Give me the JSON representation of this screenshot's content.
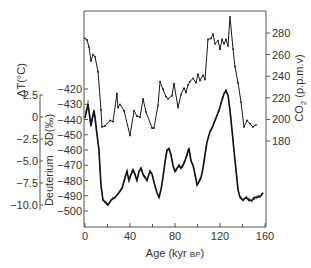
{
  "chart_data": {
    "type": "line",
    "title": "",
    "xlabel": "Age (kyr BP)",
    "xlabel_main": "Age (kyr ",
    "xlabel_unit": "BP",
    "xlabel_close": ")",
    "xlim": [
      0,
      160
    ],
    "xticks": [
      0,
      40,
      80,
      120,
      160
    ],
    "xminor_ticks": [
      20,
      60,
      100,
      140
    ],
    "grid": false,
    "legend": null,
    "axes": {
      "left_outer": {
        "label": "ΔT(°C)",
        "ticks": [
          "2.5",
          "0",
          "−2.5",
          "−5.0",
          "−7.5",
          "−10.0"
        ],
        "tick_values": [
          2.5,
          0,
          -2.5,
          -5.0,
          -7.5,
          -10.0
        ],
        "ylim": [
          -10.0,
          2.5
        ]
      },
      "left_inner": {
        "label": "Deuterium  δD(‰)",
        "label_part1": "Deuterium",
        "label_part2": "δD(‰)",
        "ticks": [
          "−420",
          "−430",
          "−440",
          "−450",
          "−460",
          "−470",
          "−480",
          "−490",
          "−500"
        ],
        "tick_values": [
          -420,
          -430,
          -440,
          -450,
          -460,
          -470,
          -480,
          -490,
          -500
        ],
        "ylim": [
          -500,
          -420
        ]
      },
      "right": {
        "label": "CO2 (p.p.m.v)",
        "label_main": "CO",
        "label_sub": "2",
        "label_unit": " (p.p.m.v)",
        "ticks": [
          "280",
          "260",
          "240",
          "220",
          "200",
          "180"
        ],
        "tick_values": [
          280,
          260,
          240,
          220,
          200,
          180
        ],
        "ylim": [
          180,
          280
        ]
      }
    },
    "series": [
      {
        "name": "CO2",
        "axis": "right",
        "style": "line-with-markers",
        "x": [
          0,
          1.8,
          3.6,
          5.3,
          7.1,
          8.9,
          11.6,
          14.2,
          15.1,
          17.8,
          22.2,
          24.9,
          28.4,
          29.3,
          31.1,
          34.7,
          40.0,
          43.6,
          46.2,
          48.9,
          51.6,
          54.2,
          59.6,
          61.3,
          64.9,
          66.7,
          69.3,
          72.0,
          73.8,
          77.3,
          79.1,
          82.7,
          85.3,
          88.0,
          89.8,
          91.6,
          93.3,
          96.0,
          98.7,
          100.4,
          102.2,
          104.9,
          106.7,
          109.3,
          112.0,
          113.8,
          115.6,
          118.2,
          120.0,
          121.8,
          123.6,
          125.3,
          127.1,
          128.9,
          131.6,
          133.3,
          136.0,
          138.7,
          141.3,
          144.0,
          146.7,
          149.3,
          152.0
        ],
        "values": [
          275,
          273.5,
          267,
          254,
          260,
          258,
          244,
          209,
          193,
          194,
          199,
          198,
          224,
          211,
          214,
          208,
          185,
          208,
          203,
          202,
          219,
          207,
          192,
          192,
          213,
          235,
          228,
          221,
          219,
          222,
          233,
          211,
          223,
          229,
          225,
          232,
          235,
          238,
          234,
          242,
          236,
          241,
          237,
          274,
          275,
          279,
          270,
          273,
          265,
          274,
          270,
          274,
          268,
          295,
          265,
          249,
          234,
          216,
          193,
          199,
          196,
          193,
          195
        ]
      },
      {
        "name": "Deuterium δD",
        "axis": "left_inner",
        "style": "noisy-line",
        "x": [
          0,
          2.7,
          5.3,
          8.0,
          9.8,
          10.7,
          12.4,
          14.2,
          16.0,
          17.8,
          20.4,
          23.1,
          26.7,
          30.2,
          32.9,
          35.6,
          37.3,
          39.1,
          40.9,
          42.7,
          44.4,
          46.2,
          48.0,
          49.8,
          51.6,
          53.3,
          55.1,
          57.8,
          59.6,
          61.3,
          64.0,
          65.8,
          67.6,
          69.3,
          71.1,
          72.9,
          74.7,
          76.4,
          78.2,
          80.0,
          81.8,
          83.6,
          85.3,
          87.1,
          88.9,
          90.7,
          92.4,
          94.2,
          96.0,
          97.8,
          99.6,
          101.3,
          103.1,
          104.9,
          106.7,
          108.4,
          111.1,
          113.8,
          116.4,
          119.1,
          121.8,
          123.6,
          125.3,
          127.1,
          128.9,
          130.7,
          132.4,
          134.2,
          136.0,
          137.8,
          140.4,
          143.1,
          145.8,
          148.4,
          151.1,
          153.8,
          156.4,
          158.2
        ],
        "values": [
          -439,
          -430,
          -444,
          -434,
          -444,
          -450,
          -460,
          -483,
          -493,
          -494,
          -496,
          -493,
          -491,
          -488,
          -485,
          -478,
          -474,
          -480,
          -476,
          -473,
          -476,
          -480,
          -474,
          -472,
          -476,
          -478,
          -480,
          -474,
          -476,
          -481,
          -488,
          -491,
          -486,
          -478,
          -468,
          -460,
          -459,
          -463,
          -470,
          -474,
          -472,
          -470,
          -472,
          -470,
          -467,
          -463,
          -459,
          -467,
          -470,
          -476,
          -483,
          -481,
          -478,
          -472,
          -463,
          -455,
          -448,
          -444,
          -439,
          -434,
          -427,
          -423,
          -421,
          -424,
          -434,
          -447,
          -460,
          -473,
          -486,
          -491,
          -493,
          -491,
          -493,
          -493,
          -491,
          -491,
          -490,
          -488
        ]
      }
    ]
  },
  "colors": {
    "line": "#1a1a1a",
    "axis": "#555555",
    "text": "#333333",
    "background": "#ffffff"
  }
}
